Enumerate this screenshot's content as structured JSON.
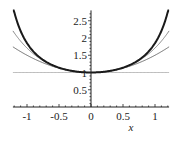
{
  "chart_data": {
    "type": "line",
    "title": "",
    "xlabel": "x",
    "ylabel": "",
    "xlim": [
      -1.22,
      1.22
    ],
    "ylim": [
      0,
      2.8
    ],
    "grid": false,
    "legend": null,
    "x_ticks": [
      -1,
      -0.5,
      0,
      0.5,
      1
    ],
    "x_tick_labels": [
      "-1",
      "-0.5",
      "0",
      "0.5",
      "1"
    ],
    "y_ticks": [
      0.5,
      1,
      1.5,
      2,
      2.5
    ],
    "y_tick_labels": [
      "0.5",
      "1",
      "1.5",
      "2",
      "2.5"
    ],
    "series": [
      {
        "name": "sec(x)",
        "expr": "sec",
        "color": "#1a1a1a",
        "width": 2.0
      },
      {
        "name": "1 + x^2/2 + 5x^4/24",
        "expr": "t4",
        "color": "#8a8a8a",
        "width": 1.0
      },
      {
        "name": "1 + x^2/2",
        "expr": "t2",
        "color": "#707070",
        "width": 1.0
      },
      {
        "name": "1",
        "expr": "t0",
        "color": "#b0b0b0",
        "width": 1.0
      }
    ],
    "sample_points": {
      "x": [
        -1.2,
        -1.0,
        -0.5,
        0,
        0.5,
        1.0,
        1.2
      ],
      "sec": [
        2.76,
        1.85,
        1.14,
        1.0,
        1.14,
        1.85,
        2.76
      ],
      "t4": [
        2.15,
        1.71,
        1.14,
        1.0,
        1.14,
        1.71,
        2.15
      ],
      "t2": [
        1.72,
        1.5,
        1.125,
        1.0,
        1.125,
        1.5,
        1.72
      ],
      "t0": [
        1,
        1,
        1,
        1,
        1,
        1,
        1
      ]
    }
  }
}
